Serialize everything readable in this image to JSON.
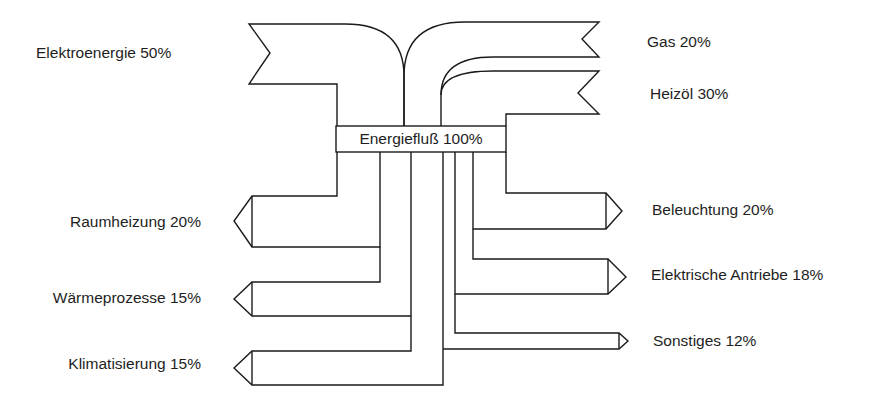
{
  "diagram": {
    "type": "sankey",
    "title": "Energiefluß 100%",
    "stroke_color": "#1a1a1a",
    "background": "#ffffff",
    "center": {
      "label": "Energiefluß 100%",
      "value_percent": 100
    },
    "inputs": [
      {
        "id": "elektroenergie",
        "label": "Elektroenergie 50%",
        "name": "Elektroenergie",
        "percent": 50,
        "side": "left"
      },
      {
        "id": "gas",
        "label": "Gas 20%",
        "name": "Gas",
        "percent": 20,
        "side": "right"
      },
      {
        "id": "heizoel",
        "label": "Heizöl 30%",
        "name": "Heizöl",
        "percent": 30,
        "side": "right"
      }
    ],
    "outputs": [
      {
        "id": "raumheizung",
        "label": "Raumheizung 20%",
        "name": "Raumheizung",
        "percent": 20,
        "side": "left"
      },
      {
        "id": "waermeprozesse",
        "label": "Wärmeprozesse 15%",
        "name": "Wärmeprozesse",
        "percent": 15,
        "side": "left"
      },
      {
        "id": "klimatisierung",
        "label": "Klimatisierung 15%",
        "name": "Klimatisierung",
        "percent": 15,
        "side": "left"
      },
      {
        "id": "beleuchtung",
        "label": "Beleuchtung 20%",
        "name": "Beleuchtung",
        "percent": 20,
        "side": "right"
      },
      {
        "id": "elektrische_antriebe",
        "label": "Elektrische Antriebe 18%",
        "name": "Elektrische Antriebe",
        "percent": 18,
        "side": "right"
      },
      {
        "id": "sonstiges",
        "label": "Sonstiges 12%",
        "name": "Sonstiges",
        "percent": 12,
        "side": "right"
      }
    ]
  }
}
